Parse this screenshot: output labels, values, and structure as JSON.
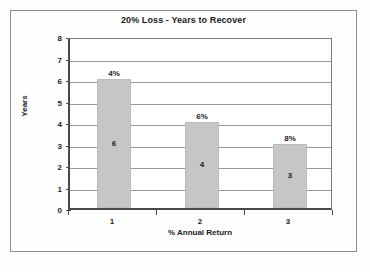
{
  "chart_data": {
    "type": "bar",
    "title": "20% Loss - Years to Recover",
    "xlabel": "% Annual Return",
    "ylabel": "Years",
    "categories": [
      "1",
      "2",
      "3"
    ],
    "values": [
      6,
      4,
      3
    ],
    "annotations": [
      "4%",
      "6%",
      "8%"
    ],
    "ylim": [
      0,
      8
    ],
    "yticks": [
      "0",
      "1",
      "2",
      "3",
      "4",
      "5",
      "6",
      "7",
      "8"
    ],
    "grid": true,
    "legend": "none",
    "series": [
      {
        "name": "Years to Recover",
        "values": [
          6,
          4,
          3
        ]
      }
    ],
    "bar_color": "#c6c6c6",
    "plot_background": "#ffffff",
    "axis_color": "#4a4a4a",
    "grid_color": "#9b9b9b"
  }
}
